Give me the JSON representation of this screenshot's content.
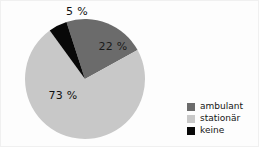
{
  "chart_data": {
    "type": "pie",
    "title": "",
    "categories": [
      "ambulant",
      "stationär",
      "keine"
    ],
    "values": [
      22,
      73,
      5
    ],
    "labels": [
      "22 %",
      "73 %",
      "5 %"
    ],
    "colors": [
      "#6b6b6b",
      "#c8c8c8",
      "#080808"
    ],
    "start_angle_deg": -18,
    "direction": "clockwise",
    "legend": {
      "position": "right",
      "entries": [
        {
          "label": "ambulant",
          "color": "#6b6b6b"
        },
        {
          "label": "stationär",
          "color": "#c8c8c8"
        },
        {
          "label": "keine",
          "color": "#080808"
        }
      ]
    },
    "geometry": {
      "center_x": 84,
      "center_y": 78,
      "radius": 60
    },
    "label_positions": [
      {
        "text": "22 %",
        "x": 112,
        "y": 49
      },
      {
        "text": "73 %",
        "x": 62,
        "y": 98
      },
      {
        "text": "5 %",
        "x": 76,
        "y": 14
      }
    ],
    "background": "#fdfdfd",
    "border_color": "#f0f0f0"
  }
}
